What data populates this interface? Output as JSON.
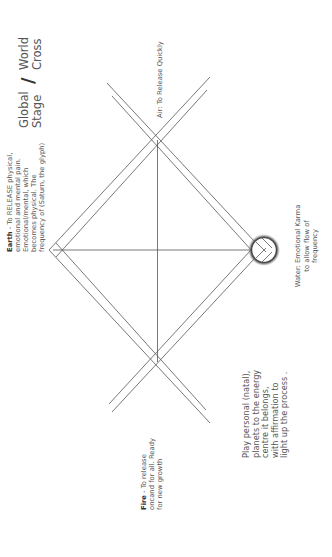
{
  "title": {
    "line1_left": "Global",
    "line2_left": "Stage",
    "slash": "/",
    "line1_right": "World",
    "line2_right": "Cross"
  },
  "labels": {
    "air": "Air: To Release Quickly",
    "earth": {
      "bold": "Earth",
      "lines": [
        " - To RELEASE physical,",
        "emotional and mental pain.",
        "Emotional/mental, which",
        "becomes physical. The",
        "frequency of (Saturn, the glyph)"
      ]
    },
    "fire": {
      "bold": "Fire",
      "lines": [
        " - To release",
        "oncand for all. Ready",
        "for new growth"
      ]
    },
    "water": {
      "lines": [
        "Water: Emotional Karma",
        "to allow flow of",
        "frequency"
      ]
    },
    "play": {
      "lines": [
        "Play personal (natal),",
        "planets to the energy",
        "centre it belongs,",
        "with affirmation to",
        "light up the process ."
      ]
    }
  },
  "diagram": {
    "line_color": "#555555",
    "left_apex": [
      53,
      250
    ],
    "right_apex": [
      264,
      250
    ],
    "top_cross": [
      158,
      137
    ],
    "bottom_cross": [
      157,
      364
    ],
    "circle": {
      "cx": 264,
      "cy": 250,
      "r": 13
    }
  }
}
